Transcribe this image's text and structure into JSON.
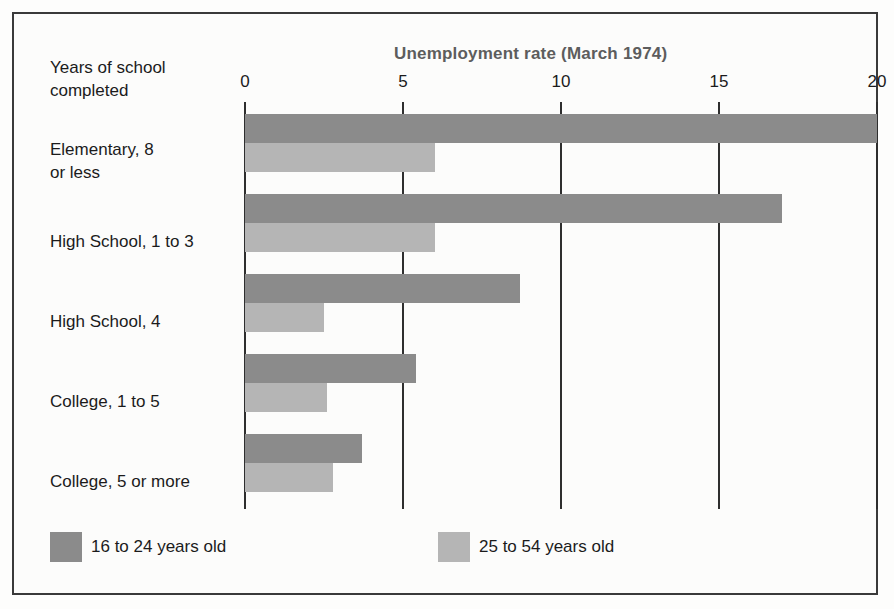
{
  "chart_data": {
    "type": "bar",
    "orientation": "horizontal",
    "title": "Unemployment rate (March 1974)",
    "xlabel": "Unemployment rate (March 1974)",
    "ylabel": "Years of school\ncompleted",
    "ylabel_lines": [
      "Years of school",
      "completed"
    ],
    "categories": [
      "Elementary, 8\nor less",
      "High School, 1 to 3",
      "High School, 4",
      "College, 1 to 5",
      "College, 5 or more"
    ],
    "series": [
      {
        "name": "16 to 24 years old",
        "color": "#8b8b8b",
        "values": [
          20.0,
          17.0,
          8.7,
          5.4,
          3.7
        ]
      },
      {
        "name": "25 to 54 years old",
        "color": "#b5b5b5",
        "values": [
          6.0,
          6.0,
          2.5,
          2.6,
          2.8
        ]
      }
    ],
    "xlim": [
      0,
      20
    ],
    "xticks": [
      0,
      5,
      10,
      15,
      20
    ],
    "xtick_labels": [
      "0",
      "5",
      "10",
      "15",
      "20"
    ],
    "grid": true,
    "legend_position": "bottom-left"
  },
  "legend": {
    "items": [
      {
        "label": "16 to 24 years old",
        "color": "#8b8b8b"
      },
      {
        "label": "25 to 54 years old",
        "color": "#b5b5b5"
      }
    ]
  },
  "colors": {
    "series_primary": "#8b8b8b",
    "series_secondary": "#b5b5b5",
    "axis": "#2e2e2e",
    "frame": "#3a3a3a",
    "title_text": "#5d5d5d",
    "body_text": "#1b1b1b"
  }
}
